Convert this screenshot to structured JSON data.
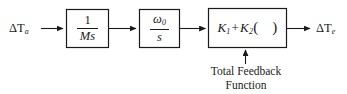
{
  "diagram": {
    "stroke_color": "#1a1a1a",
    "background_color": "#ffffff",
    "input_signal": {
      "name": "delta-T-ambient",
      "symbol": "ΔT",
      "subscript": "a"
    },
    "output_signal": {
      "name": "delta-T-element",
      "symbol": "ΔT",
      "subscript": "e"
    },
    "blocks": [
      {
        "id": "integrator-mass",
        "type": "fraction",
        "numerator": "1",
        "denominator": "Ms",
        "x": 66,
        "y": 9,
        "width": 43,
        "height": 39
      },
      {
        "id": "omega-over-s",
        "type": "fraction",
        "numerator": "ω",
        "numerator_subscript": "0",
        "denominator": "s",
        "x": 139,
        "y": 9,
        "width": 41,
        "height": 39
      },
      {
        "id": "total-feedback-gain",
        "type": "expression",
        "term1": "K",
        "term1_subscript": "1",
        "operator": "+",
        "term2": "K",
        "term2_subscript": "2",
        "open_paren": "(",
        "argument": "",
        "close_paren": ")",
        "x": 208,
        "y": 8,
        "width": 79,
        "height": 40
      }
    ],
    "feedback": {
      "label_line1": "Total Feedback",
      "label_line2": "Function",
      "arrow_direction": "up",
      "target_block": "total-feedback-gain"
    },
    "connectors": [
      {
        "id": "input-to-block1",
        "from": "input",
        "to": "integrator-mass"
      },
      {
        "id": "block1-to-block2",
        "from": "integrator-mass",
        "to": "omega-over-s"
      },
      {
        "id": "block2-to-block3",
        "from": "omega-over-s",
        "to": "total-feedback-gain"
      },
      {
        "id": "block3-to-output",
        "from": "total-feedback-gain",
        "to": "output"
      }
    ]
  }
}
